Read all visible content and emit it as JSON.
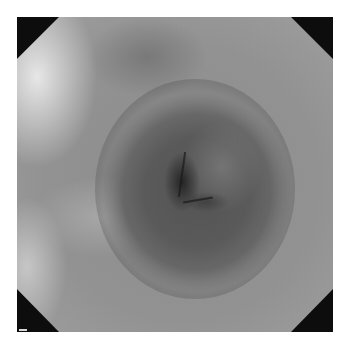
{
  "image": {
    "type": "endoscopic-view",
    "color_mode": "grayscale",
    "frame_shape": "octagon",
    "mask_color": "#0d0d0d",
    "background_color": "#ffffff",
    "features": [
      "lumen",
      "mucosal-folds",
      "octagonal-black-mask"
    ]
  }
}
